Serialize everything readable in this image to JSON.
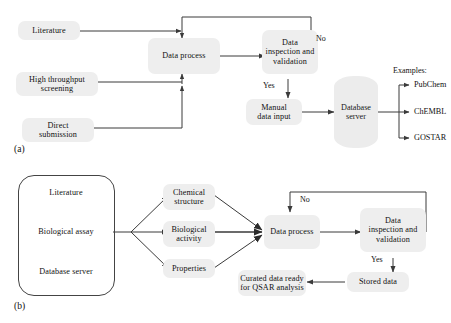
{
  "figure": {
    "panels": [
      {
        "tag": "(a)"
      },
      {
        "tag": "(b)"
      }
    ]
  },
  "panel_a": {
    "tag": "(a)",
    "sources": [
      {
        "id": "literature",
        "label": "Literature"
      },
      {
        "id": "high-throughput-screening",
        "label": "High throughput\nscreening"
      },
      {
        "id": "direct-submission",
        "label": "Direct\nsubmission"
      }
    ],
    "process": {
      "id": "data-process",
      "label": "Data process"
    },
    "inspection": {
      "id": "data-inspection-and-validation",
      "label": "Data\ninspection and\nvalidation"
    },
    "manual_input": {
      "id": "manual-data-input",
      "label": "Manual\ndata input"
    },
    "database_server": {
      "id": "database-server",
      "label": "Database\nserver"
    },
    "edge_labels": {
      "no": "No",
      "yes": "Yes"
    },
    "examples_title": "Examples:",
    "examples": [
      {
        "label": "PubChem"
      },
      {
        "label": "ChEMBL"
      },
      {
        "label": "GOSTAR"
      }
    ]
  },
  "panel_b": {
    "tag": "(b)",
    "group_sources": [
      {
        "id": "literature",
        "label": "Literature"
      },
      {
        "id": "biological-assay",
        "label": "Biological assay"
      },
      {
        "id": "database-server",
        "label": "Database server"
      }
    ],
    "data_types": [
      {
        "id": "chemical-structure",
        "label": "Chemical\nstructure"
      },
      {
        "id": "biological-activity",
        "label": "Biological\nactivity"
      },
      {
        "id": "properties",
        "label": "Properties"
      }
    ],
    "process": {
      "id": "data-process",
      "label": "Data process"
    },
    "inspection": {
      "id": "data-inspection-and-validation",
      "label": "Data\ninspection and\nvalidation"
    },
    "stored": {
      "id": "stored-data",
      "label": "Stored data"
    },
    "curated": {
      "id": "curated-data",
      "label": "Curated data ready\nfor QSAR analysis"
    },
    "edge_labels": {
      "no": "No",
      "yes": "Yes"
    }
  },
  "style": {
    "node_fill": "#eeeeee",
    "line_color": "#3a3a3a",
    "text_color": "#111111",
    "page_background": "#ffffff"
  }
}
